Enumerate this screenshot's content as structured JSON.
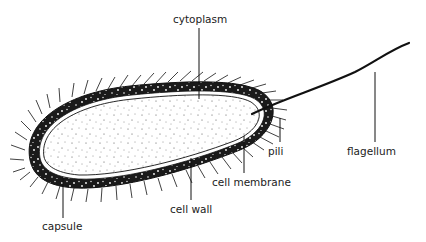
{
  "diagram": {
    "labels": {
      "cytoplasm": "cytoplasm",
      "flagellum": "flagellum",
      "pili": "pili",
      "cell_membrane": "cell membrane",
      "cell_wall": "cell wall",
      "capsule": "capsule"
    },
    "colors": {
      "ink": "#111111",
      "background": "#ffffff",
      "text": "#222222"
    }
  }
}
